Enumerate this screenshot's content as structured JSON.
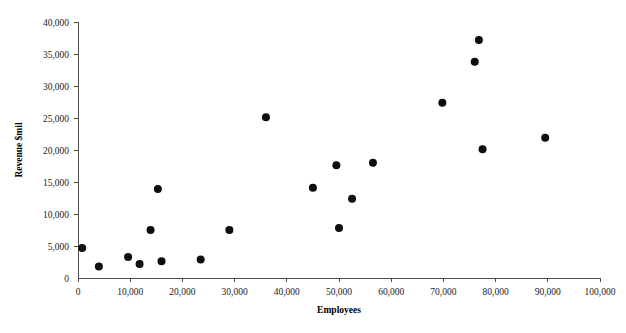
{
  "chart_data": {
    "type": "scatter",
    "title": "",
    "xlabel": "Employees",
    "ylabel": "Revenue $mil",
    "xlim": [
      0,
      100000
    ],
    "ylim": [
      0,
      40000
    ],
    "xticks": [
      0,
      10000,
      20000,
      30000,
      40000,
      50000,
      60000,
      70000,
      80000,
      90000,
      100000
    ],
    "yticks": [
      0,
      5000,
      10000,
      15000,
      20000,
      25000,
      30000,
      35000,
      40000
    ],
    "xtick_labels": [
      "0",
      "10,000",
      "20,000",
      "30,000",
      "40,000",
      "50,000",
      "60,000",
      "70,000",
      "80,000",
      "90,000",
      "100,000"
    ],
    "ytick_labels": [
      "0",
      "5,000",
      "10,000",
      "15,000",
      "20,000",
      "25,000",
      "30,000",
      "35,000",
      "40,000"
    ],
    "grid": false,
    "legend": false,
    "legend_position": "none",
    "marker": "circle",
    "marker_color": "#0d0d0d",
    "marker_size": 4,
    "series": [
      {
        "name": "Companies",
        "points": [
          {
            "x": 800,
            "y": 4700
          },
          {
            "x": 4000,
            "y": 1800
          },
          {
            "x": 9600,
            "y": 3300
          },
          {
            "x": 11800,
            "y": 2200
          },
          {
            "x": 13900,
            "y": 7500
          },
          {
            "x": 15300,
            "y": 13900
          },
          {
            "x": 16000,
            "y": 2600
          },
          {
            "x": 23500,
            "y": 2900
          },
          {
            "x": 29000,
            "y": 7500
          },
          {
            "x": 36000,
            "y": 25100
          },
          {
            "x": 45000,
            "y": 14100
          },
          {
            "x": 49500,
            "y": 17600
          },
          {
            "x": 50000,
            "y": 7800
          },
          {
            "x": 52500,
            "y": 12400
          },
          {
            "x": 56500,
            "y": 18000
          },
          {
            "x": 69800,
            "y": 27400
          },
          {
            "x": 76000,
            "y": 33800
          },
          {
            "x": 76800,
            "y": 37200
          },
          {
            "x": 77500,
            "y": 20100
          },
          {
            "x": 89500,
            "y": 21900
          }
        ]
      }
    ]
  }
}
